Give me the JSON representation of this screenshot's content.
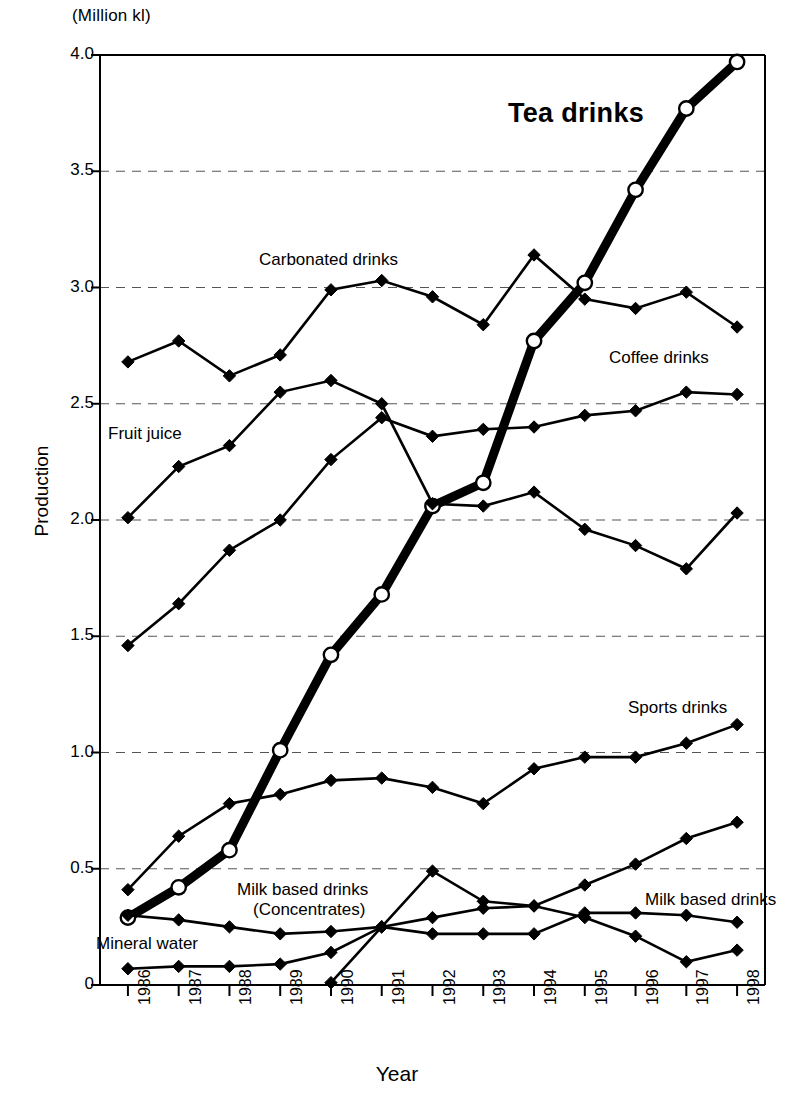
{
  "chart_data": {
    "type": "line",
    "title": "",
    "unit_note": "(Million kl)",
    "xlabel": "Year",
    "ylabel": "Production",
    "categories": [
      "1986",
      "1987",
      "1988",
      "1989",
      "1990",
      "1991",
      "1992",
      "1993",
      "1994",
      "1995",
      "1996",
      "1997",
      "1998"
    ],
    "ylim": [
      0,
      4.0
    ],
    "yticks": [
      "0",
      "0.5",
      "1.0",
      "1.5",
      "2.0",
      "2.5",
      "3.0",
      "3.5",
      "4.0"
    ],
    "ytick_values": [
      0,
      0.5,
      1.0,
      1.5,
      2.0,
      2.5,
      3.0,
      3.5,
      4.0
    ],
    "grid": "horizontal-dashed",
    "legend": "inline-annotations",
    "series": [
      {
        "name": "Tea drinks",
        "marker": "open-circle",
        "emphasis": "bold",
        "values": [
          0.29,
          0.42,
          0.58,
          1.01,
          1.42,
          1.68,
          2.06,
          2.16,
          2.77,
          3.02,
          3.42,
          3.77,
          3.97
        ]
      },
      {
        "name": "Carbonated drinks",
        "marker": "diamond",
        "emphasis": "normal",
        "values": [
          2.68,
          2.77,
          2.62,
          2.71,
          2.99,
          3.03,
          2.96,
          2.84,
          3.14,
          2.95,
          2.91,
          2.98,
          2.83
        ]
      },
      {
        "name": "Coffee drinks",
        "marker": "diamond",
        "emphasis": "normal",
        "values": [
          1.46,
          1.64,
          1.87,
          2.0,
          2.26,
          2.44,
          2.36,
          2.39,
          2.4,
          2.45,
          2.47,
          2.55,
          2.54
        ]
      },
      {
        "name": "Fruit juice",
        "marker": "diamond",
        "emphasis": "normal",
        "values": [
          2.01,
          2.23,
          2.32,
          2.55,
          2.6,
          2.5,
          2.07,
          2.06,
          2.12,
          1.96,
          1.89,
          1.79,
          2.03
        ]
      },
      {
        "name": "Sports drinks",
        "marker": "diamond",
        "emphasis": "normal",
        "values": [
          0.41,
          0.64,
          0.78,
          0.82,
          0.88,
          0.89,
          0.85,
          0.78,
          0.93,
          0.98,
          0.98,
          1.04,
          1.12
        ]
      },
      {
        "name": "Milk based drinks (Concentrates)",
        "marker": "diamond",
        "emphasis": "normal",
        "values": [
          null,
          null,
          null,
          null,
          0.01,
          0.25,
          0.49,
          0.36,
          0.34,
          0.29,
          0.21,
          0.1,
          0.15
        ]
      },
      {
        "name": "Milk based drinks",
        "marker": "diamond",
        "emphasis": "normal",
        "values": [
          0.3,
          0.28,
          0.25,
          0.22,
          0.23,
          0.25,
          0.22,
          0.22,
          0.22,
          0.31,
          0.31,
          0.3,
          0.27
        ]
      },
      {
        "name": "Mineral water",
        "marker": "diamond",
        "emphasis": "normal",
        "values": [
          0.07,
          0.08,
          0.08,
          0.09,
          0.14,
          0.25,
          0.29,
          0.33,
          0.34,
          0.43,
          0.52,
          0.63,
          0.7
        ]
      }
    ],
    "annotations": [
      {
        "id": "tea",
        "text": "Tea drinks",
        "x": 508,
        "y": 98,
        "style": "big"
      },
      {
        "id": "carbonated",
        "text": "Carbonated drinks",
        "x": 259,
        "y": 250,
        "style": "normal"
      },
      {
        "id": "coffee",
        "text": "Coffee drinks",
        "x": 609,
        "y": 348,
        "style": "normal"
      },
      {
        "id": "fruit-juice",
        "text": "Fruit juice",
        "x": 108,
        "y": 424,
        "style": "normal"
      },
      {
        "id": "sports",
        "text": "Sports drinks",
        "x": 628,
        "y": 698,
        "style": "normal"
      },
      {
        "id": "concentrates-1",
        "text": "Milk based drinks",
        "x": 237,
        "y": 880,
        "style": "normal"
      },
      {
        "id": "concentrates-2",
        "text": "(Concentrates)",
        "x": 253,
        "y": 900,
        "style": "normal"
      },
      {
        "id": "milk",
        "text": "Milk based drinks",
        "x": 645,
        "y": 890,
        "style": "normal"
      },
      {
        "id": "mineral",
        "text": "Mineral water",
        "x": 96,
        "y": 934,
        "style": "normal"
      }
    ]
  }
}
